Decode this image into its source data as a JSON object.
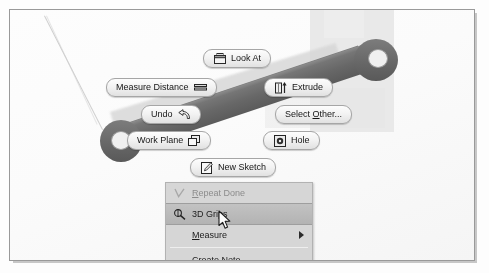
{
  "app": {
    "context": "CAD 3D modeling viewport with marking menu and context menu"
  },
  "marking_menu": {
    "items": [
      {
        "id": "look-at",
        "label": "Look At",
        "icon": "look-at-icon",
        "icon_side": "left",
        "x": 193,
        "y": 39,
        "accel": ""
      },
      {
        "id": "measure-distance",
        "label": "Measure Distance",
        "icon": "measure-distance-icon",
        "icon_side": "right",
        "x": 96,
        "y": 68,
        "accel": ""
      },
      {
        "id": "extrude",
        "label": "Extrude",
        "icon": "extrude-icon",
        "icon_side": "left",
        "x": 254,
        "y": 68,
        "accel": ""
      },
      {
        "id": "undo",
        "label": "Undo",
        "icon": "undo-icon",
        "icon_side": "right",
        "x": 131,
        "y": 95,
        "accel": ""
      },
      {
        "id": "select-other",
        "label": "Select Other...",
        "icon": "",
        "icon_side": "none",
        "x": 265,
        "y": 95,
        "accel": "O"
      },
      {
        "id": "work-plane",
        "label": "Work Plane",
        "icon": "work-plane-icon",
        "icon_side": "right",
        "x": 117,
        "y": 121,
        "accel": ""
      },
      {
        "id": "hole",
        "label": "Hole",
        "icon": "hole-icon",
        "icon_side": "left",
        "x": 253,
        "y": 121,
        "accel": ""
      },
      {
        "id": "new-sketch",
        "label": "New Sketch",
        "icon": "new-sketch-icon",
        "icon_side": "left",
        "x": 180,
        "y": 148,
        "accel": ""
      }
    ]
  },
  "context_menu": {
    "items": [
      {
        "id": "repeat-done",
        "label": "Repeat Done",
        "accel": "R",
        "state": "disabled",
        "icon": "check-icon",
        "submenu": false
      },
      {
        "id": "3d-grips",
        "label": "3D Grips",
        "accel": "",
        "state": "highlighted",
        "icon": "3d-grips-icon",
        "submenu": false
      },
      {
        "id": "measure",
        "label": "Measure",
        "accel": "M",
        "state": "normal",
        "icon": "",
        "submenu": true
      },
      {
        "id": "create-note",
        "label": "Create Note",
        "accel": "C",
        "state": "normal",
        "icon": "",
        "submenu": false
      },
      {
        "id": "export-face-as",
        "label": "Export Face As...",
        "accel": "E",
        "state": "normal",
        "icon": "",
        "submenu": false
      }
    ]
  },
  "cursor": {
    "name": "arrow-cursor",
    "x": 208,
    "y": 200
  },
  "colors": {
    "page_background": "#fdfdfd",
    "page_border": "#9a9a9a",
    "part_fill": "#6f6f6f",
    "menu_background": "#d8d8d8",
    "menu_highlight": "#bdbdbd",
    "disabled_text": "#8d8d8d",
    "text": "#1b1b1b"
  }
}
